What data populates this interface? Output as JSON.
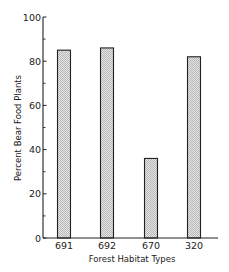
{
  "chart_data": {
    "type": "bar",
    "title": "",
    "xlabel": "Forest Habitat Types",
    "ylabel": "Percent Bear Food Plants",
    "categories": [
      "691",
      "692",
      "670",
      "320"
    ],
    "values": [
      85,
      86,
      36,
      82
    ],
    "ylim": [
      0,
      100
    ],
    "yticks_major": [
      0,
      20,
      40,
      60,
      80,
      100
    ],
    "yticks_minor": [
      10,
      30,
      50,
      70,
      90
    ],
    "ytick_labels": [
      "0",
      "20",
      "40",
      "60",
      "80",
      "100"
    ],
    "grid": false,
    "legend": null,
    "bar_fill": "#d4d4d4",
    "bar_edge": "#222222"
  }
}
